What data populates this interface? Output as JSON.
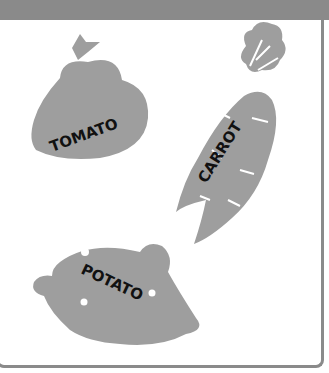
{
  "figure": {
    "items": [
      {
        "name": "tomato",
        "label": "TOMATO"
      },
      {
        "name": "carrot",
        "label": "CARROT"
      },
      {
        "name": "potato",
        "label": "POTATO"
      }
    ],
    "colors": {
      "shape": "#9e9e9e",
      "frame": "#8a8a8a",
      "text": "#111111",
      "background": "#ffffff"
    }
  }
}
